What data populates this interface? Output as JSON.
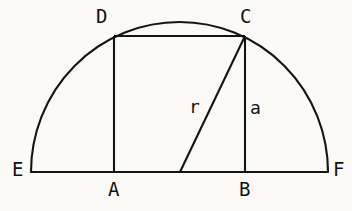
{
  "figure": {
    "kind": "geometry-diagram",
    "background_color": "#fbfaf7",
    "stroke_color": "#141414",
    "stroke_width": 2.1,
    "canvas": {
      "width": 352,
      "height": 211
    }
  },
  "chart_data": {
    "type": "diagram",
    "title": "",
    "xlabel": "",
    "ylabel": "",
    "grid": false,
    "legend": "none",
    "points": [
      {
        "name": "E",
        "x": 31,
        "y": 172
      },
      {
        "name": "A",
        "x": 114,
        "y": 172
      },
      {
        "name": "O",
        "x": 180,
        "y": 172
      },
      {
        "name": "B",
        "x": 245,
        "y": 172
      },
      {
        "name": "F",
        "x": 328,
        "y": 172
      },
      {
        "name": "D",
        "x": 114,
        "y": 36
      },
      {
        "name": "C",
        "x": 245,
        "y": 36
      }
    ],
    "segments": [
      {
        "name": "EF-baseline",
        "from": "E",
        "to": "F"
      },
      {
        "name": "AD-vertical",
        "from": "A",
        "to": "D"
      },
      {
        "name": "BC-vertical",
        "from": "B",
        "to": "C"
      },
      {
        "name": "DC-top",
        "from": "D",
        "to": "C"
      },
      {
        "name": "OC-radius",
        "from": "O",
        "to": "C"
      }
    ],
    "arc": {
      "name": "semicircle-EF",
      "center_x": 180,
      "center_y": 172,
      "radius_x": 148.5,
      "radius_y": 150,
      "start_x": 31,
      "start_y": 172,
      "end_x": 328,
      "end_y": 172,
      "sweep": "upper-half"
    }
  },
  "labels": {
    "vertex_D": "D",
    "vertex_C": "C",
    "vertex_E": "E",
    "vertex_F": "F",
    "vertex_A": "A",
    "vertex_B": "B",
    "measure_r": "r",
    "measure_a": "a"
  }
}
